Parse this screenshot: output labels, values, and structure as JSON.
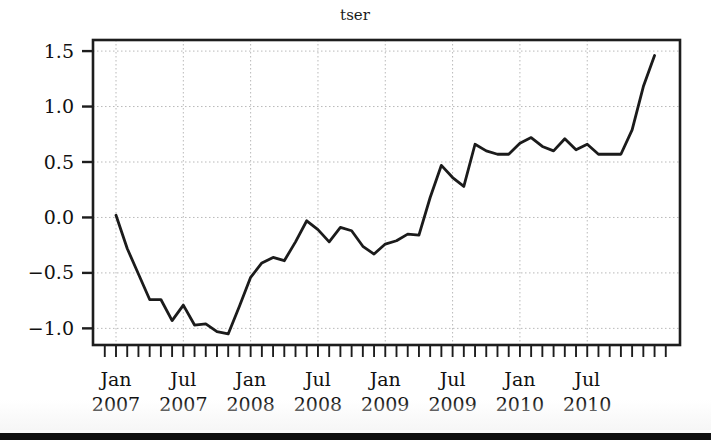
{
  "figure": {
    "title": "tser",
    "background_color": "#ffffff",
    "line_color": "#1b1b1b",
    "grid_color": "#b9b9b9",
    "axis_color": "#1d1d1d",
    "footer_bar_color": "#141414"
  },
  "chart_data": {
    "type": "line",
    "title": "tser",
    "xlabel": "",
    "ylabel": "",
    "ylim": [
      -1.15,
      1.6
    ],
    "xlim": [
      "2006-12",
      "2011-02"
    ],
    "grid": true,
    "legend": false,
    "y_ticks": [
      -1.0,
      -0.5,
      0.0,
      0.5,
      1.0,
      1.5
    ],
    "y_tick_labels": [
      "-1.0",
      "-0.5",
      "0.0",
      "0.5",
      "1.0",
      "1.5"
    ],
    "x_tick_labels": [
      {
        "month": "Jan",
        "year": "2007"
      },
      {
        "month": "Jul",
        "year": "2007"
      },
      {
        "month": "Jan",
        "year": "2008"
      },
      {
        "month": "Jul",
        "year": "2008"
      },
      {
        "month": "Jan",
        "year": "2009"
      },
      {
        "month": "Jul",
        "year": "2009"
      },
      {
        "month": "Jan",
        "year": "2010"
      },
      {
        "month": "Jul",
        "year": "2010"
      }
    ],
    "x_minor_tick_interval": "1 month",
    "series": [
      {
        "name": "tser",
        "x": [
          "2007-01",
          "2007-02",
          "2007-03",
          "2007-04",
          "2007-05",
          "2007-06",
          "2007-07",
          "2007-08",
          "2007-09",
          "2007-10",
          "2007-11",
          "2007-12",
          "2008-01",
          "2008-02",
          "2008-03",
          "2008-04",
          "2008-05",
          "2008-06",
          "2008-07",
          "2008-08",
          "2008-09",
          "2008-10",
          "2008-11",
          "2008-12",
          "2009-01",
          "2009-02",
          "2009-03",
          "2009-04",
          "2009-05",
          "2009-06",
          "2009-07",
          "2009-08",
          "2009-09",
          "2009-10",
          "2009-11",
          "2009-12",
          "2010-01",
          "2010-02",
          "2010-03",
          "2010-04",
          "2010-05",
          "2010-06",
          "2010-07",
          "2010-08",
          "2010-09",
          "2010-10",
          "2010-11",
          "2010-12",
          "2011-01"
        ],
        "values": [
          0.02,
          -0.28,
          -0.51,
          -0.74,
          -0.74,
          -0.93,
          -0.79,
          -0.97,
          -0.96,
          -1.03,
          -1.05,
          -0.8,
          -0.54,
          -0.41,
          -0.36,
          -0.39,
          -0.22,
          -0.03,
          -0.11,
          -0.22,
          -0.09,
          -0.12,
          -0.26,
          -0.33,
          -0.24,
          -0.21,
          -0.15,
          -0.16,
          0.18,
          0.47,
          0.36,
          0.28,
          0.66,
          0.6,
          0.57,
          0.57,
          0.67,
          0.72,
          0.64,
          0.6,
          0.71,
          0.61,
          0.66,
          0.57,
          0.57,
          0.57,
          0.79,
          1.18,
          1.46
        ]
      }
    ]
  }
}
